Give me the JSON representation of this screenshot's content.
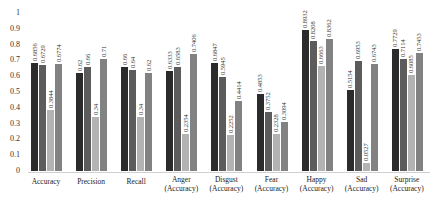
{
  "chart_data": {
    "type": "bar",
    "title": "",
    "xlabel": "",
    "ylabel": "",
    "ylim": [
      0,
      1
    ],
    "yticks": [
      "0",
      "0.1",
      "0.2",
      "0.3",
      "0.4",
      "0.5",
      "0.6",
      "0.7",
      "0.8",
      "0.9",
      "1"
    ],
    "grid": false,
    "legend": null,
    "categories": [
      [
        "Accuracy"
      ],
      [
        "Precision"
      ],
      [
        "Recall"
      ],
      [
        "Anger",
        "(Accuracy)"
      ],
      [
        "Disgust",
        "(Accuracy)"
      ],
      [
        "Fear",
        "(Accuracy)"
      ],
      [
        "Happy",
        "(Accuracy)"
      ],
      [
        "Sad",
        "(Accuracy)"
      ],
      [
        "Surprise",
        "(Accuracy)"
      ]
    ],
    "series": [
      {
        "name": "Series 1",
        "color": "#2b2b2b",
        "values": [
          0.6856,
          0.62,
          0.66,
          0.6333,
          0.6847,
          0.4853,
          0.8932,
          0.5154,
          0.7729
        ],
        "labels": [
          "0.6856",
          "0.62",
          "0.66",
          "0.6333",
          "0.6847",
          "0.4853",
          "0.8932",
          "0.5154",
          "0.7729"
        ]
      },
      {
        "name": "Series 2",
        "color": "#5c5c5c",
        "values": [
          0.6729,
          0.66,
          0.64,
          0.6583,
          0.5945,
          0.3752,
          0.8208,
          0.6953,
          0.7114
        ],
        "labels": [
          "0.6729",
          "0.66",
          "0.64",
          "0.6583",
          "0.5945",
          "0.3752",
          "0.8208",
          "0.6953",
          "0.7114"
        ]
      },
      {
        "name": "Series 3",
        "color": "#b3b3b3",
        "values": [
          0.3844,
          0.34,
          0.34,
          0.2354,
          0.2252,
          0.2328,
          0.6663,
          0.0527,
          0.6085
        ],
        "labels": [
          "0.3844",
          "0.34",
          "0.34",
          "0.2354",
          "0.2252",
          "0.2328",
          "0.6663",
          "0.0527",
          "0.6085"
        ]
      },
      {
        "name": "Series 4",
        "color": "#828282",
        "values": [
          0.6774,
          0.71,
          0.62,
          0.7406,
          0.4414,
          0.3094,
          0.8362,
          0.6743,
          0.7453
        ],
        "labels": [
          "0.6774",
          "0.71",
          "0.62",
          "0.7406",
          "0.4414",
          "0.3094",
          "0.8362",
          "0.6743",
          "0.7453"
        ]
      }
    ]
  }
}
